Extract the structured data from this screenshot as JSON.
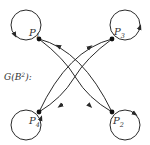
{
  "graph": {
    "label": "G(B",
    "label_sup": "2",
    "label_suffix": "):",
    "colors": {
      "stroke": "#2a2a2a",
      "node": "#111111",
      "text": "#333333"
    },
    "nodes": [
      {
        "id": "P1",
        "letter": "P",
        "sub": "1",
        "x": 39,
        "y": 39,
        "loop_cx": 26,
        "loop_cy": 25
      },
      {
        "id": "P3",
        "letter": "P",
        "sub": "3",
        "x": 112,
        "y": 39,
        "loop_cx": 125,
        "loop_cy": 25
      },
      {
        "id": "P4",
        "letter": "P",
        "sub": "4",
        "x": 39,
        "y": 112,
        "loop_cx": 26,
        "loop_cy": 125
      },
      {
        "id": "P2",
        "letter": "P",
        "sub": "2",
        "x": 112,
        "y": 112,
        "loop_cx": 125,
        "loop_cy": 125
      }
    ],
    "edges": [
      {
        "from": "P1",
        "to": "P2",
        "directed": true
      },
      {
        "from": "P2",
        "to": "P1",
        "directed": true
      },
      {
        "from": "P3",
        "to": "P4",
        "directed": true
      },
      {
        "from": "P4",
        "to": "P3",
        "directed": true
      }
    ],
    "loops": [
      "P1",
      "P2",
      "P3",
      "P4"
    ]
  }
}
